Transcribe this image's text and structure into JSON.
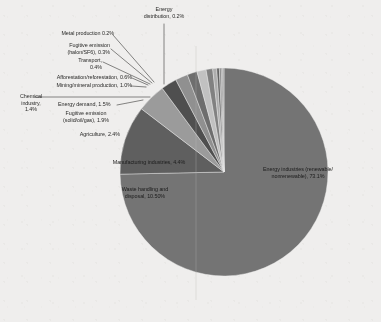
{
  "chart_data": {
    "type": "pie",
    "title": "",
    "legend_position": "none",
    "labels_on_slices": true,
    "start_angle_deg": 0,
    "direction": "clockwise",
    "categories": [
      "Energy industries (renewable/ nonrenewable)",
      "Waste handling and disposal",
      "Manufacturing industries",
      "Agriculture",
      "Fugitive emission (solid/oil/gas)",
      "Energy demand",
      "Chemical industry",
      "Mining/mineral production",
      "Afforestation/reforestation",
      "Transport",
      "Fugitive emission (halon/SF6)",
      "Metal production",
      "Energy distribution"
    ],
    "values": [
      73.1,
      10.5,
      4.4,
      2.4,
      1.9,
      1.5,
      1.4,
      1.0,
      0.6,
      0.4,
      0.3,
      0.2,
      0.2
    ],
    "unit": "%",
    "colors": [
      "#6f6f6f",
      "#5a5a5a",
      "#9a9a9a",
      "#4a4a4a",
      "#8e8e8e",
      "#6a6a6a",
      "#c3c3c3",
      "#7e7e7e",
      "#adadad",
      "#5f5f5f",
      "#8a8a8a",
      "#707070",
      "#9f9f9f"
    ]
  },
  "labels": {
    "energy_distribution": "Energy\ndistribution, 0.2%",
    "metal_production": "Metal production 0.2%",
    "fugitive_halon": "Fugitive emission\n(halon/SF6), 0.3%",
    "transport": "Transport,\n0.4%",
    "afforestation": "Afforestation/reforestation, 0.6%",
    "mining": "Mining/mineral production, 1.0%",
    "chemical_industry": "Chemical\nindustry,\n1.4%",
    "energy_demand": "Energy demand, 1.5%",
    "fugitive_solid": "Fugitive emission\n(solid/oil/gas), 1.9%",
    "agriculture": "Agriculture, 2.4%",
    "manufacturing": "Manufacturing industries, 4.4%",
    "waste": "Waste handling and\ndisposal, 10.50%",
    "energy_industries": "Energy industries (renewable/\nnonrenewable), 73.1%"
  }
}
